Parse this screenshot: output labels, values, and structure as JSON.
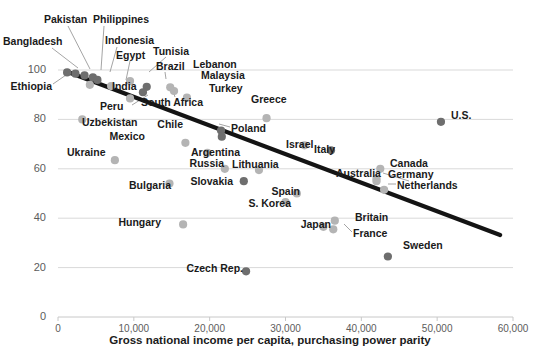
{
  "chart_data": {
    "type": "scatter",
    "title": "",
    "xlabel": "Gross national income per capita, purchasing power parity",
    "ylabel": "",
    "xlim": [
      0,
      60000
    ],
    "ylim": [
      0,
      100
    ],
    "grid": true,
    "legend": "none",
    "xticks": [
      "0",
      "10,000",
      "20,000",
      "30,000",
      "40,000",
      "50,000",
      "60,000"
    ],
    "xtick_values": [
      0,
      10000,
      20000,
      30000,
      40000,
      50000,
      60000
    ],
    "yticks": [
      "0",
      "20",
      "40",
      "60",
      "80",
      "100"
    ],
    "ytick_values": [
      0,
      20,
      40,
      60,
      80,
      100
    ],
    "trendline": {
      "x0": 1300,
      "y0": 99.2,
      "x1": 58300,
      "y1": 33.2
    },
    "points": [
      {
        "name": "Ethiopia",
        "x": 1200,
        "y": 99.0,
        "shade": "dark",
        "label_x": 52,
        "label_y": 81,
        "anchor": "r",
        "leader": [
          [
            53,
            84
          ],
          [
            66,
            75
          ]
        ]
      },
      {
        "name": "Bangladesh",
        "x": 2300,
        "y": 98.5,
        "shade": "dark",
        "label_x": 3,
        "label_y": 36,
        "anchor": "l",
        "leader": [
          [
            52,
            48
          ],
          [
            78,
            68
          ]
        ]
      },
      {
        "name": "Pakistan",
        "x": 3500,
        "y": 97.8,
        "shade": "dark",
        "label_x": 44,
        "label_y": 14,
        "anchor": "l",
        "leader": [
          [
            68,
            26
          ],
          [
            90,
            69
          ]
        ]
      },
      {
        "name": "Philippines",
        "x": 4600,
        "y": 97.0,
        "shade": "dark",
        "label_x": 93,
        "label_y": 14,
        "anchor": "l",
        "leader": [
          [
            104,
            26
          ],
          [
            101,
            70
          ]
        ]
      },
      {
        "name": "Indonesia",
        "x": 5200,
        "y": 96.0,
        "shade": "dark",
        "label_x": 105,
        "label_y": 35,
        "anchor": "l",
        "leader": [
          [
            117,
            47
          ],
          [
            110,
            72
          ]
        ]
      },
      {
        "name": "India",
        "x": 4200,
        "y": 94.0,
        "shade": "light",
        "label_x": 112,
        "label_y": 81,
        "anchor": "l",
        "leader": [
          [
            112,
            85
          ],
          [
            102,
            85
          ]
        ]
      },
      {
        "name": "Egypt",
        "x": 7000,
        "y": 93.5,
        "shade": "light",
        "label_x": 116,
        "label_y": 50,
        "anchor": "l",
        "leader": [
          [
            130,
            61
          ],
          [
            126,
            80
          ]
        ]
      },
      {
        "name": "Tunisia",
        "x": 9500,
        "y": 95.5,
        "shade": "light",
        "label_x": 153,
        "label_y": 46,
        "anchor": "l",
        "leader": [
          [
            166,
            57
          ],
          [
            149,
            72
          ]
        ]
      },
      {
        "name": "Brazil",
        "x": 11700,
        "y": 93.2,
        "shade": "dark",
        "label_x": 156,
        "label_y": 61,
        "anchor": "l",
        "leader": [
          [
            165,
            72
          ],
          [
            166,
            79
          ]
        ]
      },
      {
        "name": "South Africa",
        "x": 11200,
        "y": 91.0,
        "shade": "dark",
        "label_x": 141,
        "label_y": 97,
        "anchor": "l",
        "leader": [
          [
            175,
            97
          ],
          [
            172,
            88
          ]
        ]
      },
      {
        "name": "Lebanon",
        "x": 14800,
        "y": 93.0,
        "shade": "light",
        "label_x": 193,
        "label_y": 59,
        "anchor": "l",
        "leader": null
      },
      {
        "name": "Malaysia",
        "x": 15300,
        "y": 91.5,
        "shade": "light",
        "label_x": 201,
        "label_y": 70,
        "anchor": "l",
        "leader": null
      },
      {
        "name": "Turkey",
        "x": 17000,
        "y": 88.8,
        "shade": "light",
        "label_x": 209,
        "label_y": 83,
        "anchor": "l",
        "leader": null
      },
      {
        "name": "Peru",
        "x": 9500,
        "y": 88.5,
        "shade": "light",
        "label_x": 100,
        "label_y": 101,
        "anchor": "l",
        "leader": [
          [
            132,
            105
          ],
          [
            148,
            95
          ]
        ]
      },
      {
        "name": "Uzbekistan",
        "x": 3200,
        "y": 80.0,
        "shade": "light",
        "label_x": 82,
        "label_y": 117,
        "anchor": "l",
        "leader": null
      },
      {
        "name": "Greece",
        "x": 27500,
        "y": 80.5,
        "shade": "light",
        "label_x": 251,
        "label_y": 94,
        "anchor": "l",
        "leader": null
      },
      {
        "name": "U.S.",
        "x": 50500,
        "y": 79.0,
        "shade": "dark",
        "label_x": 451,
        "label_y": 110,
        "anchor": "l",
        "leader": null
      },
      {
        "name": "Chile",
        "x": 21500,
        "y": 75.5,
        "shade": "dark",
        "label_x": 183,
        "label_y": 119,
        "anchor": "r",
        "leader": null
      },
      {
        "name": "Poland",
        "x": 21600,
        "y": 73.0,
        "shade": "dark",
        "label_x": 231,
        "label_y": 123,
        "anchor": "l",
        "leader": [
          [
            230,
            127
          ],
          [
            219,
            124
          ]
        ]
      },
      {
        "name": "Mexico",
        "x": 16800,
        "y": 70.5,
        "shade": "light",
        "label_x": 145,
        "label_y": 131,
        "anchor": "r",
        "leader": null
      },
      {
        "name": "Israel",
        "x": 32500,
        "y": 69.5,
        "shade": "light",
        "label_x": 286,
        "label_y": 139,
        "anchor": "l",
        "leader": null
      },
      {
        "name": "Italy",
        "x": 36000,
        "y": 67.5,
        "shade": "dark",
        "label_x": 314,
        "label_y": 144,
        "anchor": "l",
        "leader": null
      },
      {
        "name": "Argentina",
        "x": 19700,
        "y": 66.5,
        "shade": "light",
        "label_x": 191,
        "label_y": 147,
        "anchor": "l",
        "leader": null
      },
      {
        "name": "Ukraine",
        "x": 7500,
        "y": 63.5,
        "shade": "light",
        "label_x": 67,
        "label_y": 147,
        "anchor": "l",
        "leader": null
      },
      {
        "name": "Russia",
        "x": 22000,
        "y": 60.0,
        "shade": "light",
        "label_x": 224,
        "label_y": 158,
        "anchor": "r",
        "leader": null
      },
      {
        "name": "Lithuania",
        "x": 26500,
        "y": 59.5,
        "shade": "light",
        "label_x": 232,
        "label_y": 159,
        "anchor": "l",
        "leader": null
      },
      {
        "name": "Canada",
        "x": 42500,
        "y": 60.0,
        "shade": "light",
        "label_x": 390,
        "label_y": 158,
        "anchor": "l",
        "leader": null
      },
      {
        "name": "Australia",
        "x": 42000,
        "y": 55.0,
        "shade": "light",
        "label_x": 336,
        "label_y": 168,
        "anchor": "l",
        "leader": [
          [
            383,
            173
          ],
          [
            409,
            181
          ]
        ]
      },
      {
        "name": "Germany",
        "x": 42000,
        "y": 56.0,
        "shade": "light",
        "label_x": 388,
        "label_y": 169,
        "anchor": "l",
        "leader": null
      },
      {
        "name": "Slovakia",
        "x": 24500,
        "y": 55.0,
        "shade": "dark",
        "label_x": 233,
        "label_y": 176,
        "anchor": "r",
        "leader": null
      },
      {
        "name": "Bulgaria",
        "x": 14700,
        "y": 54.0,
        "shade": "light",
        "label_x": 171,
        "label_y": 180,
        "anchor": "r",
        "leader": null
      },
      {
        "name": "Netherlands",
        "x": 43000,
        "y": 51.5,
        "shade": "light",
        "label_x": 397,
        "label_y": 180,
        "anchor": "l",
        "leader": [
          [
            396,
            184
          ],
          [
            388,
            184
          ]
        ]
      },
      {
        "name": "Spain",
        "x": 31500,
        "y": 50.0,
        "shade": "light",
        "label_x": 300,
        "label_y": 186,
        "anchor": "r",
        "leader": null
      },
      {
        "name": "S. Korea",
        "x": 30000,
        "y": 46.5,
        "shade": "light",
        "label_x": 291,
        "label_y": 198,
        "anchor": "r",
        "leader": null
      },
      {
        "name": "Hungary",
        "x": 16500,
        "y": 37.5,
        "shade": "light",
        "label_x": 161,
        "label_y": 217,
        "anchor": "r",
        "leader": null
      },
      {
        "name": "Britain",
        "x": 36500,
        "y": 39.0,
        "shade": "light",
        "label_x": 355,
        "label_y": 212,
        "anchor": "l",
        "leader": null
      },
      {
        "name": "Japan",
        "x": 35000,
        "y": 36.5,
        "shade": "light",
        "label_x": 331,
        "label_y": 219,
        "anchor": "r",
        "leader": null
      },
      {
        "name": "France",
        "x": 36300,
        "y": 35.5,
        "shade": "light",
        "label_x": 353,
        "label_y": 228,
        "anchor": "l",
        "leader": [
          [
            352,
            232
          ],
          [
            344,
            224
          ]
        ]
      },
      {
        "name": "Sweden",
        "x": 43500,
        "y": 24.5,
        "shade": "dark",
        "label_x": 403,
        "label_y": 240,
        "anchor": "l",
        "leader": null
      },
      {
        "name": "Czech Rep.",
        "x": 24800,
        "y": 18.5,
        "shade": "dark",
        "label_x": 243,
        "label_y": 263,
        "anchor": "r",
        "leader": null
      }
    ],
    "colors": {
      "dot_dark": "#6e6e6e",
      "dot_light": "#b4b4b4",
      "trendline": "#141414",
      "gridline": "#d9d9d9",
      "label_text": "#1a1a1a",
      "tick_text": "#5c5c5c"
    }
  }
}
